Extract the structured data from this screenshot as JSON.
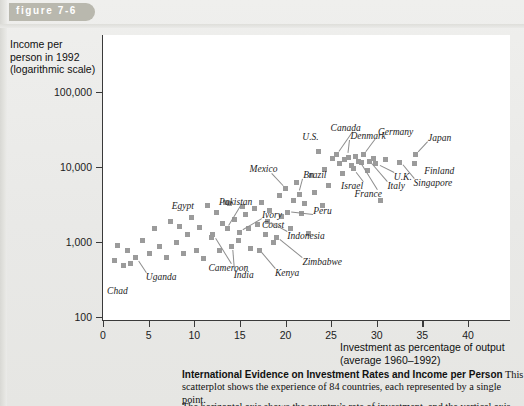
{
  "figure": {
    "tab_label": "figure 7-6"
  },
  "axes": {
    "y_title": "Income per person in 1992 (logarithmic scale)",
    "y_title_lines": [
      "Income per",
      "person in 1992",
      "(logarithmic scale)"
    ],
    "x_title_lines": [
      "Investment as percentage of output",
      "(average 1960–1992)"
    ],
    "y_ticks": [
      "100,000",
      "10,000",
      "1,000",
      "100"
    ],
    "x_ticks": [
      "0",
      "5",
      "10",
      "15",
      "20",
      "25",
      "30",
      "35",
      "40"
    ]
  },
  "caption": {
    "heading": "International Evidence on Investment Rates and Income per Person",
    "body": "This scatterplot shows the experience of 84 countries, each represented by a single point.",
    "body_line3": "The horizontal axis shows the country’s rate of investment, and the vertical axis"
  },
  "chart_data": {
    "type": "scatter",
    "title": "International Evidence on Investment Rates and Income per Person",
    "xlabel": "Investment as percentage of output (average 1960-1992)",
    "ylabel": "Income per person in 1992 (logarithmic scale)",
    "xlim": [
      0,
      44.6
    ],
    "ylim": [
      100,
      100000
    ],
    "yscale": "log",
    "grid": false,
    "legend": null,
    "n_countries": 84,
    "marker": {
      "shape": "square",
      "color": "#9b9b9b",
      "size_px": 5
    },
    "labeled_points": [
      {
        "name": "Chad",
        "x": 2.2,
        "y": 480
      },
      {
        "name": "Uganda",
        "x": 3.6,
        "y": 620
      },
      {
        "name": "Egypt",
        "x": 8.4,
        "y": 1600
      },
      {
        "name": "Cameroon",
        "x": 12.0,
        "y": 1250
      },
      {
        "name": "Pakistan",
        "x": 13.6,
        "y": 1500
      },
      {
        "name": "India",
        "x": 14.1,
        "y": 880
      },
      {
        "name": "Ivory Coast",
        "x": 15.0,
        "y": 1350
      },
      {
        "name": "Kenya",
        "x": 17.1,
        "y": 780
      },
      {
        "name": "Indonesia",
        "x": 18.0,
        "y": 1900
      },
      {
        "name": "Zimbabwe",
        "x": 19.0,
        "y": 1150
      },
      {
        "name": "Mexico",
        "x": 20.0,
        "y": 5200
      },
      {
        "name": "Peru",
        "x": 20.2,
        "y": 2500
      },
      {
        "name": "Brazil",
        "x": 21.5,
        "y": 4300
      },
      {
        "name": "U.S.",
        "x": 23.6,
        "y": 16000
      },
      {
        "name": "Canada",
        "x": 25.6,
        "y": 14500
      },
      {
        "name": "Denmark",
        "x": 26.9,
        "y": 13500
      },
      {
        "name": "Israel",
        "x": 27.4,
        "y": 9500
      },
      {
        "name": "France",
        "x": 28.0,
        "y": 12000
      },
      {
        "name": "Germany",
        "x": 28.6,
        "y": 14500
      },
      {
        "name": "Italy",
        "x": 29.2,
        "y": 12000
      },
      {
        "name": "U.K.",
        "x": 29.9,
        "y": 11000
      },
      {
        "name": "Singapore",
        "x": 32.5,
        "y": 11500
      },
      {
        "name": "Finland",
        "x": 34.1,
        "y": 11000
      },
      {
        "name": "Japan",
        "x": 34.3,
        "y": 14500
      }
    ],
    "points": [
      [
        1.3,
        560
      ],
      [
        1.6,
        900
      ],
      [
        2.2,
        480
      ],
      [
        2.7,
        760
      ],
      [
        3.0,
        520
      ],
      [
        3.6,
        620
      ],
      [
        4.3,
        1050
      ],
      [
        5.1,
        700
      ],
      [
        5.6,
        1500
      ],
      [
        6.2,
        880
      ],
      [
        7.0,
        620
      ],
      [
        7.4,
        1900
      ],
      [
        8.0,
        1000
      ],
      [
        8.4,
        1600
      ],
      [
        8.8,
        700
      ],
      [
        9.3,
        1250
      ],
      [
        9.7,
        2100
      ],
      [
        10.2,
        780
      ],
      [
        10.6,
        1550
      ],
      [
        11.0,
        600
      ],
      [
        11.4,
        3100
      ],
      [
        11.9,
        1150
      ],
      [
        12.0,
        1250
      ],
      [
        12.4,
        2500
      ],
      [
        12.8,
        780
      ],
      [
        13.1,
        1750
      ],
      [
        13.4,
        3400
      ],
      [
        13.6,
        1500
      ],
      [
        13.9,
        3300
      ],
      [
        14.1,
        880
      ],
      [
        14.4,
        2000
      ],
      [
        14.8,
        1050
      ],
      [
        15.0,
        1350
      ],
      [
        15.3,
        3000
      ],
      [
        15.6,
        2350
      ],
      [
        15.9,
        1500
      ],
      [
        16.2,
        820
      ],
      [
        16.6,
        2800
      ],
      [
        16.9,
        1700
      ],
      [
        17.1,
        780
      ],
      [
        17.4,
        3400
      ],
      [
        17.8,
        1250
      ],
      [
        18.0,
        1900
      ],
      [
        18.3,
        2600
      ],
      [
        18.7,
        1000
      ],
      [
        19.0,
        1150
      ],
      [
        19.3,
        4200
      ],
      [
        19.6,
        2200
      ],
      [
        20.0,
        5200
      ],
      [
        20.2,
        2500
      ],
      [
        20.6,
        1500
      ],
      [
        20.9,
        3600
      ],
      [
        21.2,
        6200
      ],
      [
        21.5,
        4300
      ],
      [
        21.8,
        2400
      ],
      [
        22.1,
        3300
      ],
      [
        22.5,
        1300
      ],
      [
        22.9,
        7600
      ],
      [
        23.2,
        4600
      ],
      [
        23.6,
        16000
      ],
      [
        24.0,
        3100
      ],
      [
        24.3,
        9200
      ],
      [
        24.7,
        5600
      ],
      [
        25.1,
        13000
      ],
      [
        25.6,
        14500
      ],
      [
        25.9,
        11000
      ],
      [
        26.2,
        8200
      ],
      [
        26.5,
        12500
      ],
      [
        26.9,
        13500
      ],
      [
        27.2,
        10500
      ],
      [
        27.4,
        9500
      ],
      [
        27.7,
        14000
      ],
      [
        28.0,
        12000
      ],
      [
        28.3,
        11500
      ],
      [
        28.6,
        14500
      ],
      [
        29.0,
        9000
      ],
      [
        29.2,
        12000
      ],
      [
        29.6,
        13000
      ],
      [
        29.9,
        11000
      ],
      [
        30.4,
        3600
      ],
      [
        31.0,
        12500
      ],
      [
        32.5,
        11500
      ],
      [
        34.1,
        11000
      ],
      [
        34.3,
        14500
      ]
    ]
  }
}
